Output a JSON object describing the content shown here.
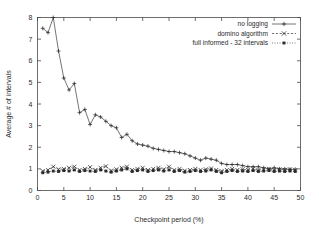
{
  "chart_data": {
    "type": "line",
    "title": "",
    "xlabel": "Checkpoint period (%)",
    "ylabel": "Average # of intervals",
    "xlim": [
      0,
      50
    ],
    "ylim": [
      0,
      8
    ],
    "xticks": [
      0,
      5,
      10,
      15,
      20,
      25,
      30,
      35,
      40,
      45,
      50
    ],
    "yticks": [
      0,
      1,
      2,
      3,
      4,
      5,
      6,
      7,
      8
    ],
    "xtick_labels": [
      "0",
      "5",
      "10",
      "15",
      "20",
      "25",
      "30",
      "35",
      "40",
      "45",
      "50"
    ],
    "ytick_labels": [
      "0",
      "1",
      "2",
      "3",
      "4",
      "5",
      "6",
      "7",
      "8"
    ],
    "grid": false,
    "legend_position": "top-right",
    "x": [
      1,
      2,
      3,
      4,
      5,
      6,
      7,
      8,
      9,
      10,
      11,
      12,
      13,
      14,
      15,
      16,
      17,
      18,
      19,
      20,
      21,
      22,
      23,
      24,
      25,
      26,
      27,
      28,
      29,
      30,
      31,
      32,
      33,
      34,
      35,
      36,
      37,
      38,
      39,
      40,
      41,
      42,
      43,
      44,
      45,
      46,
      47,
      48,
      49
    ],
    "series": [
      {
        "name": "no logging",
        "marker": "plus",
        "linestyle": "solid",
        "values": [
          7.5,
          7.3,
          8.0,
          6.45,
          5.2,
          4.65,
          4.95,
          3.6,
          3.75,
          3.05,
          3.5,
          3.4,
          3.2,
          3.0,
          2.9,
          2.45,
          2.6,
          2.3,
          2.15,
          2.1,
          2.05,
          1.95,
          1.9,
          1.85,
          1.8,
          1.8,
          1.75,
          1.7,
          1.6,
          1.5,
          1.4,
          1.5,
          1.45,
          1.4,
          1.25,
          1.2,
          1.2,
          1.2,
          1.15,
          1.1,
          1.1,
          1.1,
          1.05,
          1.0,
          1.05,
          1.0,
          1.0,
          0.98,
          0.98
        ]
      },
      {
        "name": "domino algorithm",
        "marker": "cross",
        "linestyle": "dashed",
        "values": [
          0.9,
          0.95,
          1.1,
          0.98,
          1.0,
          1.05,
          1.1,
          0.95,
          1.0,
          1.08,
          0.95,
          1.05,
          1.12,
          0.92,
          0.98,
          1.05,
          1.1,
          0.95,
          1.0,
          1.05,
          0.95,
          1.0,
          1.05,
          0.98,
          1.1,
          0.95,
          1.0,
          0.92,
          0.95,
          1.0,
          0.95,
          0.98,
          1.02,
          0.95,
          0.9,
          0.95,
          1.0,
          0.95,
          0.98,
          0.95,
          1.0,
          0.95,
          0.98,
          1.0,
          0.95,
          0.98,
          0.95,
          0.98,
          0.95
        ]
      },
      {
        "name": "full informed - 32 intervals",
        "marker": "square",
        "linestyle": "dotted",
        "values": [
          0.82,
          0.85,
          0.9,
          0.88,
          0.92,
          0.9,
          0.95,
          0.88,
          0.92,
          0.9,
          0.88,
          0.95,
          0.9,
          0.85,
          0.9,
          0.95,
          1.0,
          0.88,
          0.92,
          0.95,
          0.88,
          0.92,
          0.95,
          0.9,
          0.95,
          0.88,
          0.92,
          0.85,
          0.88,
          0.92,
          0.88,
          0.9,
          0.95,
          0.88,
          0.82,
          0.88,
          0.92,
          0.88,
          0.9,
          0.88,
          0.92,
          0.88,
          0.9,
          0.92,
          0.88,
          0.9,
          0.88,
          0.9,
          0.88
        ]
      }
    ]
  },
  "legend": {
    "entries": [
      {
        "label": "no logging",
        "marker": "plus-icon"
      },
      {
        "label": "domino algorithm",
        "marker": "cross-icon"
      },
      {
        "label": "full informed - 32 intervals",
        "marker": "square-icon"
      }
    ]
  },
  "colors": {
    "background": "#ffffff",
    "axis": "#4a4a4a",
    "line": "#3a3a3a",
    "text": "#2b2b2b"
  }
}
